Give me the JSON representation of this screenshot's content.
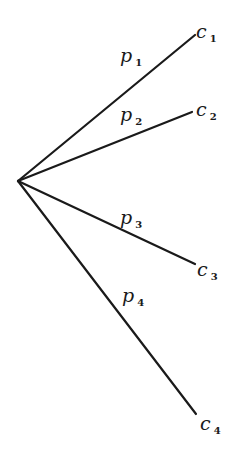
{
  "diagram": {
    "type": "branching-tree",
    "root": {
      "x": 18,
      "y": 181
    },
    "stroke_color": "#1a1a1a",
    "background": "#ffffff",
    "branches": [
      {
        "id": "b1",
        "probability": {
          "base": "p",
          "sub": "1",
          "x": 120,
          "y": 46
        },
        "outcome": {
          "base": "c",
          "sub": "1",
          "x": 196,
          "y": 22
        },
        "end": {
          "x": 195,
          "y": 35
        }
      },
      {
        "id": "b2",
        "probability": {
          "base": "p",
          "sub": "2",
          "x": 120,
          "y": 105
        },
        "outcome": {
          "base": "c",
          "sub": "2",
          "x": 196,
          "y": 100
        },
        "end": {
          "x": 192,
          "y": 112
        }
      },
      {
        "id": "b3",
        "probability": {
          "base": "p",
          "sub": "3",
          "x": 120,
          "y": 208
        },
        "outcome": {
          "base": "c",
          "sub": "3",
          "x": 197,
          "y": 260
        },
        "end": {
          "x": 195,
          "y": 264
        }
      },
      {
        "id": "b4",
        "probability": {
          "base": "p",
          "sub": "4",
          "x": 122,
          "y": 286
        },
        "outcome": {
          "base": "c",
          "sub": "4",
          "x": 200,
          "y": 414
        },
        "end": {
          "x": 196,
          "y": 414
        }
      }
    ]
  }
}
